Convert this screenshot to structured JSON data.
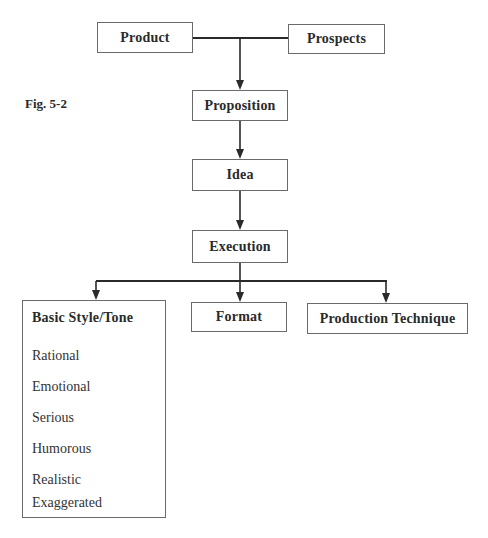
{
  "figure": {
    "label": "Fig. 5-2"
  },
  "nodes": {
    "product": "Product",
    "prospects": "Prospects",
    "proposition": "Proposition",
    "idea": "Idea",
    "execution": "Execution",
    "format": "Format",
    "production_technique": "Production Technique"
  },
  "basic_style": {
    "title": "Basic Style/Tone",
    "items": [
      "Rational",
      "Emotional",
      "Serious",
      "Humorous",
      "Realistic",
      "Exaggerated"
    ]
  },
  "colors": {
    "line": "#2a2a2a",
    "border": "#6a6a6a",
    "text": "#2a2a2a"
  }
}
